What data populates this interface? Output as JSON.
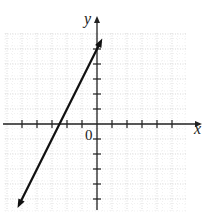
{
  "chart_data": {
    "type": "line",
    "title": "",
    "xlabel": "x",
    "ylabel": "y",
    "origin_label": "0",
    "xlim": [
      -6,
      6
    ],
    "ylim": [
      -6,
      6
    ],
    "grid": true,
    "x_ticks": [
      -5,
      -4,
      -3,
      -2,
      -1,
      1,
      2,
      3,
      4,
      5
    ],
    "y_ticks": [
      -5,
      -4,
      -3,
      -2,
      -1,
      1,
      2,
      3,
      4,
      5
    ],
    "tick_labels_shown": false,
    "series": [
      {
        "name": "line",
        "equation": "y = 2x + 5",
        "slope": 2,
        "y_intercept": 5,
        "x_intercept": -2.5,
        "arrows": "both ends",
        "x": [
          -5.3,
          0.35
        ],
        "y": [
          -5.6,
          5.7
        ]
      }
    ]
  },
  "layout": {
    "origin_px": [
      97,
      124
    ],
    "unit_px": 15,
    "grid_left": 5,
    "grid_right": 186,
    "grid_top": 33,
    "grid_bottom": 211,
    "x_axis_end": 202,
    "y_axis_top": 16,
    "y_axis_bottom": 210,
    "x_axis_start": 3
  },
  "colors": {
    "axis": "#222222",
    "line": "#111111",
    "grid": "#c8c8c8"
  }
}
